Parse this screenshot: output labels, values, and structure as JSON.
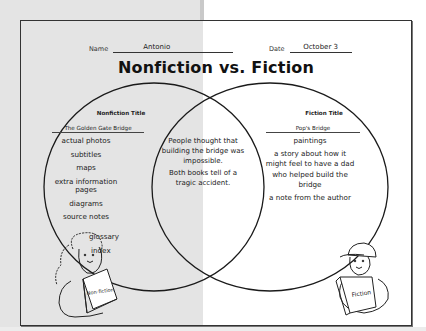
{
  "document": {
    "header_fields": {
      "name_label": "Name",
      "name_value": "Antonio",
      "date_label": "Date",
      "date_value": "October 3"
    },
    "title": "Nonfiction vs. Fiction",
    "venn": {
      "left": {
        "column_title": "Nonfiction Title",
        "book_title": "The Golden Gate Bridge",
        "items": [
          "actual photos",
          "subtitles",
          "maps",
          "extra information",
          "pages",
          "diagrams",
          "source notes",
          "glossary",
          "index"
        ]
      },
      "center": {
        "items": [
          "People thought that building the bridge was impossible.",
          "Both books tell of a tragic accident."
        ]
      },
      "right": {
        "column_title": "Fiction Title",
        "book_title": "Pop's Bridge",
        "items": [
          "paintings",
          "a story about how it might feel to have a dad who helped build the bridge",
          "a note from the author"
        ]
      }
    },
    "illustrations": {
      "left_book_label": "Non-fiction",
      "right_book_label": "Fiction"
    },
    "footer": "Reading Responses for Nonfiction: Graphic Organizers & Mini-Lessons © 2008 by Jennifer Jacobson, Scholastic Teaching Resources, page 15"
  }
}
